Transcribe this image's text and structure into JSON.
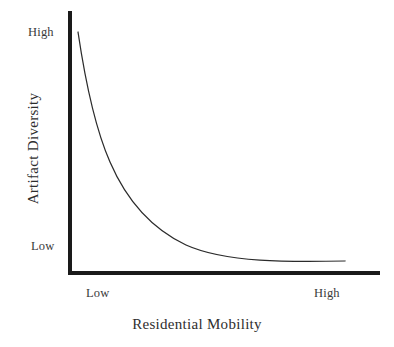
{
  "figure": {
    "background_color": "#ffffff",
    "ink_color": "#1a1a1a",
    "curve_color": "#2b2b2b"
  },
  "chart_data": {
    "type": "line",
    "title": "",
    "subtitle": "",
    "xlabel": "Residential Mobility",
    "ylabel": "Artifact Diversity",
    "xtick_labels": [
      "Low",
      "High"
    ],
    "ytick_labels": [
      "High",
      "Low"
    ],
    "xlim": [
      0,
      1
    ],
    "ylim": [
      0,
      1
    ],
    "grid": false,
    "legend": null,
    "annotations": [],
    "series": [
      {
        "name": "Artifact diversity vs residential mobility",
        "x": [
          0.0,
          0.04,
          0.08,
          0.12,
          0.17,
          0.22,
          0.28,
          0.34,
          0.41,
          0.48,
          0.56,
          0.64,
          0.72,
          0.81,
          0.9,
          1.0
        ],
        "y": [
          1.0,
          0.86,
          0.74,
          0.64,
          0.54,
          0.46,
          0.38,
          0.31,
          0.25,
          0.2,
          0.16,
          0.12,
          0.09,
          0.07,
          0.05,
          0.04
        ]
      }
    ],
    "curve_path": "M 78 32 C 86 86, 95 128, 110 162 C 126 199, 150 228, 186 245 C 226 263, 290 262, 345 261"
  },
  "labels": {
    "y_axis_title": "Artifact Diversity",
    "x_axis_title": "Residential Mobility",
    "y_tick_high": "High",
    "y_tick_low": "Low",
    "x_tick_low": "Low",
    "x_tick_high": "High"
  }
}
